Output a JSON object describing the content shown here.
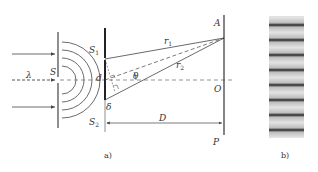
{
  "figure": {
    "panel_a": {
      "caption": "a)",
      "labels": {
        "wavelength": "λ",
        "source": "S",
        "slit1": "S",
        "slit1_sub": "1",
        "slit2": "S",
        "slit2_sub": "2",
        "slit_separation": "d",
        "path1": "r",
        "path1_sub": "1",
        "path2": "r",
        "path2_sub": "2",
        "angle": "θ",
        "path_difference": "δ",
        "screen_distance": "D",
        "point_a": "A",
        "point_o": "O",
        "point_p": "P"
      }
    },
    "panel_b": {
      "caption": "b)",
      "fringe_count": 8
    },
    "colors": {
      "line": "#444444",
      "fringe_dark": "#2a2a2a",
      "fringe_light": "#d8d8d8"
    }
  }
}
